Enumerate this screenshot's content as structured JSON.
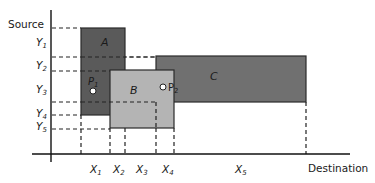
{
  "diagram": {
    "y_axis_label": "Source",
    "x_axis_label": "Destination",
    "y_ticks": [
      {
        "name": "Y",
        "sub": "1"
      },
      {
        "name": "Y",
        "sub": "2"
      },
      {
        "name": "Y",
        "sub": "3"
      },
      {
        "name": "Y",
        "sub": "4"
      },
      {
        "name": "Y",
        "sub": "5"
      }
    ],
    "x_ticks": [
      {
        "name": "X",
        "sub": "1"
      },
      {
        "name": "X",
        "sub": "2"
      },
      {
        "name": "X",
        "sub": "3"
      },
      {
        "name": "X",
        "sub": "4"
      },
      {
        "name": "X",
        "sub": "5"
      }
    ],
    "rectangles": [
      {
        "label": "A",
        "color": "#5a5a5a"
      },
      {
        "label": "B",
        "color": "#b4b4b4"
      },
      {
        "label": "C",
        "color": "#6e6e6e"
      }
    ],
    "points": [
      {
        "name": "P",
        "sub": "1"
      },
      {
        "name": "P",
        "sub": "2"
      }
    ]
  }
}
